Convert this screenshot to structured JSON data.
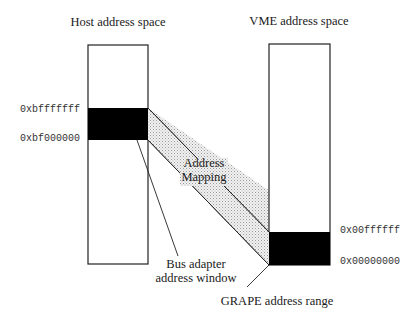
{
  "diagram": {
    "host": {
      "title": "Host address space",
      "top_address": "0xbfffffff",
      "bottom_address": "0xbf000000"
    },
    "vme": {
      "title": "VME address space",
      "top_address": "0x00ffffff",
      "bottom_address": "0x00000000"
    },
    "mapping_label_line1": "Address",
    "mapping_label_line2": "Mapping",
    "bus_adapter_line1": "Bus adapter",
    "bus_adapter_line2": "address window",
    "grape_label": "GRAPE address range",
    "colors": {
      "line": "#222222",
      "region_fill": "#000000",
      "mapping_fill": "#e2e2e2"
    }
  }
}
